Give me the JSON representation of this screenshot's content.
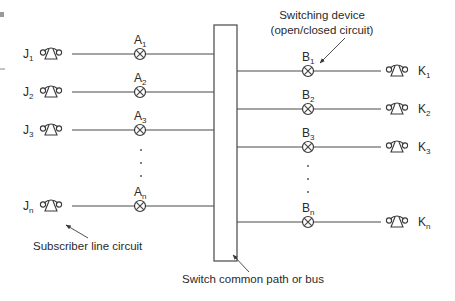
{
  "colors": {
    "line": "#4a4a4a",
    "text": "#2a2a2a",
    "background": "#ffffff"
  },
  "left_subscribers": [
    {
      "label": "J",
      "sub": "1",
      "switch_label": "A",
      "switch_sub": "1",
      "y": 54
    },
    {
      "label": "J",
      "sub": "2",
      "switch_label": "A",
      "switch_sub": "2",
      "y": 92
    },
    {
      "label": "J",
      "sub": "3",
      "switch_label": "A",
      "switch_sub": "3",
      "y": 130
    },
    {
      "label": "J",
      "sub": "n",
      "switch_label": "A",
      "switch_sub": "n",
      "y": 206
    }
  ],
  "right_subscribers": [
    {
      "label": "K",
      "sub": "1",
      "switch_label": "B",
      "switch_sub": "1",
      "y": 71
    },
    {
      "label": "K",
      "sub": "2",
      "switch_label": "B",
      "switch_sub": "2",
      "y": 109
    },
    {
      "label": "K",
      "sub": "3",
      "switch_label": "B",
      "switch_sub": "3",
      "y": 147
    },
    {
      "label": "K",
      "sub": "n",
      "switch_label": "B",
      "switch_sub": "n",
      "y": 222
    }
  ],
  "annotations": {
    "switching_device_line1": "Switching device",
    "switching_device_line2": "(open/closed circuit)",
    "subscriber_line": "Subscriber line circuit",
    "bus": "Switch common path or bus"
  },
  "icons": {
    "telephone": "telephone-icon",
    "switch": "crossed-circle-switch-icon",
    "ellipsis": "vertical-ellipsis"
  }
}
